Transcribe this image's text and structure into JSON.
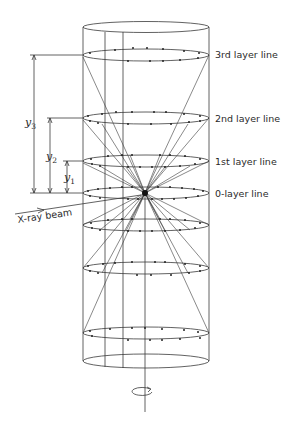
{
  "figure": {
    "layer_labels": {
      "l3": "3rd layer line",
      "l2": "2nd layer line",
      "l1": "1st layer line",
      "l0": "0-layer line"
    },
    "beam_label": "X-ray beam",
    "spacing_labels": {
      "y3": {
        "base": "y",
        "sub": "3"
      },
      "y2": {
        "base": "y",
        "sub": "2"
      },
      "y1": {
        "base": "y",
        "sub": "1"
      }
    },
    "colors": {
      "line": "#3a3a3a",
      "text": "#2a2a2a",
      "background": "#ffffff"
    }
  }
}
